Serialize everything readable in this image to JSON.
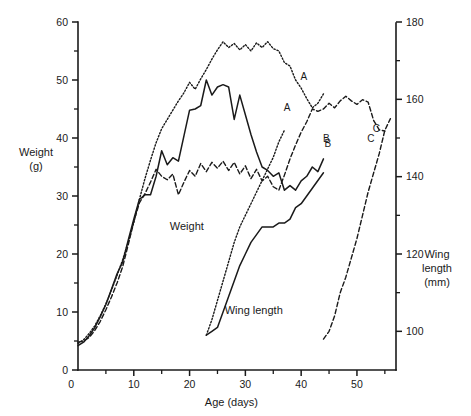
{
  "chart_data": {
    "type": "line",
    "title": "",
    "xlabel": "Age (days)",
    "ylabel": "Weight\n(g)",
    "y2label": "Wing\nlength\n(mm)",
    "xlim": [
      0,
      57
    ],
    "ylim": [
      0,
      60
    ],
    "y2lim": [
      90,
      180
    ],
    "grid": false,
    "legend": "inline-end-labels",
    "x_ticks": [
      0,
      10,
      20,
      30,
      40,
      50
    ],
    "x_tick_labels": [
      "0",
      "10",
      "20",
      "30",
      "40",
      "50"
    ],
    "x_minor_ticks": [
      5,
      15,
      25,
      35,
      45,
      55
    ],
    "y_ticks": [
      0,
      10,
      20,
      30,
      40,
      50,
      60
    ],
    "y_tick_labels": [
      "0",
      "10",
      "20",
      "30",
      "40",
      "50",
      "60"
    ],
    "y_minor_ticks": [
      5,
      15,
      25,
      35,
      45,
      55
    ],
    "y2_ticks": [
      100,
      120,
      140,
      160,
      180
    ],
    "y2_tick_labels": [
      "100",
      "120",
      "140",
      "160",
      "180"
    ],
    "y2_minor_ticks": [
      110,
      130,
      150,
      170
    ],
    "group_labels": [
      {
        "text": "Weight",
        "x": 19.5,
        "y": 24.2
      },
      {
        "text": "Wing length",
        "x": 31.5,
        "y": 9.6
      }
    ],
    "series": [
      {
        "name": "A",
        "measure": "Weight",
        "axis": "left",
        "style": "dotted",
        "label_x": 40.5,
        "label_y": 50.0,
        "points": [
          [
            0,
            4.6
          ],
          [
            1,
            5.2
          ],
          [
            2,
            6.3
          ],
          [
            3,
            7.6
          ],
          [
            4,
            9.4
          ],
          [
            5,
            11.4
          ],
          [
            6,
            13.8
          ],
          [
            7,
            16.3
          ],
          [
            8,
            19.0
          ],
          [
            9,
            22.0
          ],
          [
            10,
            25.4
          ],
          [
            11,
            29.4
          ],
          [
            12,
            33.0
          ],
          [
            13,
            36.2
          ],
          [
            14,
            39.2
          ],
          [
            15,
            41.6
          ],
          [
            16,
            43.2
          ],
          [
            17,
            44.8
          ],
          [
            18,
            46.4
          ],
          [
            19,
            47.8
          ],
          [
            20,
            49.6
          ],
          [
            21,
            48.4
          ],
          [
            22,
            50.2
          ],
          [
            23,
            51.8
          ],
          [
            24,
            53.6
          ],
          [
            25,
            55.2
          ],
          [
            26,
            56.6
          ],
          [
            27,
            55.6
          ],
          [
            28,
            56.3
          ],
          [
            29,
            55.2
          ],
          [
            30,
            56.1
          ],
          [
            31,
            55.0
          ],
          [
            32,
            56.4
          ],
          [
            33,
            55.6
          ],
          [
            34,
            56.6
          ],
          [
            35,
            55.4
          ],
          [
            36,
            55.0
          ],
          [
            37,
            53.0
          ],
          [
            38,
            52.4
          ],
          [
            39,
            50.0
          ],
          [
            40,
            48.6
          ],
          [
            41,
            46.8
          ],
          [
            42,
            45.2
          ],
          [
            43,
            46.0
          ],
          [
            44,
            47.6
          ]
        ]
      },
      {
        "name": "B",
        "measure": "Weight",
        "axis": "left",
        "style": "solid",
        "label_x": 44.8,
        "label_y": 38.5,
        "points": [
          [
            0,
            4.2
          ],
          [
            1,
            4.8
          ],
          [
            2,
            5.9
          ],
          [
            3,
            7.3
          ],
          [
            4,
            9.2
          ],
          [
            5,
            11.3
          ],
          [
            6,
            13.9
          ],
          [
            7,
            16.6
          ],
          [
            8,
            18.6
          ],
          [
            9,
            22.4
          ],
          [
            10,
            26.0
          ],
          [
            11,
            29.4
          ],
          [
            12,
            30.2
          ],
          [
            13,
            30.2
          ],
          [
            14,
            33.4
          ],
          [
            15,
            37.8
          ],
          [
            16,
            35.4
          ],
          [
            17,
            36.6
          ],
          [
            18,
            36.0
          ],
          [
            19,
            40.4
          ],
          [
            20,
            44.8
          ],
          [
            21,
            45.0
          ],
          [
            22,
            45.6
          ],
          [
            23,
            50.0
          ],
          [
            24,
            47.4
          ],
          [
            25,
            48.8
          ],
          [
            26,
            49.2
          ],
          [
            27,
            48.8
          ],
          [
            28,
            43.2
          ],
          [
            29,
            47.4
          ],
          [
            30,
            44.0
          ],
          [
            31,
            40.6
          ],
          [
            32,
            37.6
          ],
          [
            33,
            35.0
          ],
          [
            34,
            34.4
          ],
          [
            35,
            33.4
          ],
          [
            36,
            34.0
          ],
          [
            37,
            31.0
          ],
          [
            38,
            31.8
          ],
          [
            39,
            31.0
          ],
          [
            40,
            32.6
          ],
          [
            41,
            33.4
          ],
          [
            42,
            35.0
          ],
          [
            43,
            34.2
          ],
          [
            44,
            36.4
          ]
        ]
      },
      {
        "name": "C",
        "measure": "Weight",
        "axis": "left",
        "style": "dashed",
        "label_x": 53.5,
        "label_y": 41.0,
        "points": [
          [
            0,
            4.8
          ],
          [
            1,
            5.0
          ],
          [
            2,
            5.6
          ],
          [
            3,
            6.8
          ],
          [
            4,
            8.4
          ],
          [
            5,
            10.4
          ],
          [
            6,
            12.6
          ],
          [
            7,
            15.0
          ],
          [
            8,
            17.8
          ],
          [
            9,
            21.6
          ],
          [
            10,
            25.6
          ],
          [
            11,
            28.8
          ],
          [
            12,
            30.4
          ],
          [
            13,
            32.4
          ],
          [
            14,
            34.6
          ],
          [
            15,
            33.4
          ],
          [
            16,
            32.8
          ],
          [
            17,
            33.8
          ],
          [
            18,
            30.2
          ],
          [
            19,
            32.4
          ],
          [
            20,
            34.4
          ],
          [
            21,
            33.4
          ],
          [
            22,
            35.6
          ],
          [
            23,
            34.2
          ],
          [
            24,
            35.8
          ],
          [
            25,
            34.8
          ],
          [
            26,
            36.0
          ],
          [
            27,
            34.4
          ],
          [
            28,
            35.8
          ],
          [
            29,
            33.8
          ],
          [
            30,
            35.2
          ],
          [
            31,
            33.0
          ],
          [
            32,
            34.6
          ],
          [
            33,
            32.6
          ],
          [
            34,
            33.4
          ],
          [
            35,
            31.6
          ],
          [
            36,
            31.0
          ],
          [
            37,
            33.6
          ],
          [
            38,
            36.4
          ],
          [
            39,
            38.8
          ],
          [
            40,
            41.0
          ],
          [
            41,
            42.8
          ],
          [
            42,
            45.0
          ],
          [
            43,
            44.6
          ],
          [
            44,
            45.0
          ],
          [
            45,
            46.0
          ],
          [
            46,
            45.2
          ],
          [
            47,
            46.4
          ],
          [
            48,
            47.2
          ],
          [
            49,
            46.4
          ],
          [
            50,
            45.8
          ],
          [
            51,
            46.6
          ],
          [
            52,
            46.2
          ],
          [
            53,
            43.0
          ],
          [
            54,
            41.4
          ],
          [
            55,
            41.2
          ]
        ]
      },
      {
        "name": "A",
        "measure": "Wing length",
        "axis": "right",
        "style": "dotted",
        "label_x": 37.5,
        "label_y": 157,
        "points": [
          [
            23,
            99
          ],
          [
            24,
            103
          ],
          [
            25,
            108
          ],
          [
            26,
            113
          ],
          [
            27,
            118
          ],
          [
            28,
            123
          ],
          [
            29,
            127
          ],
          [
            30,
            130
          ],
          [
            31,
            133
          ],
          [
            32,
            136
          ],
          [
            33,
            139
          ],
          [
            34,
            142
          ],
          [
            35,
            145
          ],
          [
            36,
            149
          ],
          [
            37,
            152
          ]
        ]
      },
      {
        "name": "B",
        "measure": "Wing length",
        "axis": "right",
        "style": "solid",
        "label_x": 44.5,
        "label_y": 149,
        "points": [
          [
            23,
            99
          ],
          [
            24,
            100
          ],
          [
            25,
            101
          ],
          [
            26,
            105
          ],
          [
            27,
            109
          ],
          [
            28,
            113
          ],
          [
            29,
            117
          ],
          [
            30,
            120
          ],
          [
            31,
            123
          ],
          [
            32,
            125
          ],
          [
            33,
            127
          ],
          [
            34,
            127
          ],
          [
            35,
            127
          ],
          [
            36,
            128
          ],
          [
            37,
            128
          ],
          [
            38,
            129
          ],
          [
            39,
            132
          ],
          [
            40,
            133
          ],
          [
            41,
            135
          ],
          [
            42,
            137
          ],
          [
            43,
            139
          ],
          [
            44,
            141
          ]
        ]
      },
      {
        "name": "C",
        "measure": "Wing length",
        "axis": "right",
        "style": "dashed",
        "label_x": 52.5,
        "label_y": 149,
        "points": [
          [
            44,
            98
          ],
          [
            45,
            100
          ],
          [
            46,
            104
          ],
          [
            47,
            110
          ],
          [
            48,
            114
          ],
          [
            49,
            119
          ],
          [
            50,
            124
          ],
          [
            51,
            130
          ],
          [
            52,
            136
          ],
          [
            53,
            141
          ],
          [
            54,
            146
          ],
          [
            55,
            152
          ],
          [
            56,
            155
          ]
        ]
      }
    ]
  },
  "geometry": {
    "plot_left": 78,
    "plot_right": 396,
    "plot_bottom": 370,
    "plot_top": 22,
    "x_px_per_unit": 5.86,
    "y_px_per_unit": 5.8
  }
}
